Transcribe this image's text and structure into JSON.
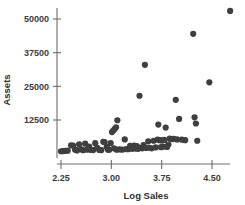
{
  "chart_data": {
    "type": "scatter",
    "title": "",
    "xlabel": "Log Sales",
    "ylabel": "Assets",
    "xlim": [
      2.11,
      4.92
    ],
    "ylim": [
      0,
      56000
    ],
    "xticks": [
      "2.25",
      "3.00",
      "3.75",
      "4.50"
    ],
    "xtick_values": [
      2.25,
      3.0,
      3.75,
      4.5
    ],
    "yticks": [
      "12500",
      "25000",
      "37500",
      "50000"
    ],
    "ytick_values": [
      12500,
      25000,
      37500,
      50000
    ],
    "grid": false,
    "legend": false,
    "marker_color": "#3f3f3f",
    "axis_color": "#6e6e6e",
    "marker_size": 3.1,
    "points": [
      [
        2.25,
        900
      ],
      [
        2.28,
        950
      ],
      [
        2.31,
        1000
      ],
      [
        2.35,
        1100
      ],
      [
        2.4,
        3100
      ],
      [
        2.43,
        3000
      ],
      [
        2.46,
        1500
      ],
      [
        2.49,
        1200
      ],
      [
        2.52,
        3500
      ],
      [
        2.55,
        1600
      ],
      [
        2.58,
        1300
      ],
      [
        2.61,
        3700
      ],
      [
        2.64,
        1500
      ],
      [
        2.67,
        2600
      ],
      [
        2.7,
        1400
      ],
      [
        2.73,
        1350
      ],
      [
        2.76,
        3900
      ],
      [
        2.79,
        2200
      ],
      [
        2.82,
        1400
      ],
      [
        2.85,
        1300
      ],
      [
        2.88,
        4400
      ],
      [
        2.9,
        4300
      ],
      [
        2.93,
        2500
      ],
      [
        2.95,
        1500
      ],
      [
        2.97,
        1450
      ],
      [
        2.99,
        3900
      ],
      [
        3.01,
        8000
      ],
      [
        3.03,
        8600
      ],
      [
        3.05,
        9200
      ],
      [
        3.07,
        9800
      ],
      [
        3.09,
        12400
      ],
      [
        3.04,
        2000
      ],
      [
        3.08,
        1500
      ],
      [
        3.12,
        1600
      ],
      [
        3.16,
        1500
      ],
      [
        3.2,
        5300
      ],
      [
        3.22,
        1700
      ],
      [
        3.25,
        1650
      ],
      [
        3.28,
        2900
      ],
      [
        3.31,
        1800
      ],
      [
        3.34,
        3000
      ],
      [
        3.36,
        1900
      ],
      [
        3.38,
        2800
      ],
      [
        3.4,
        1800
      ],
      [
        3.42,
        21500
      ],
      [
        3.44,
        2100
      ],
      [
        3.46,
        2000
      ],
      [
        3.48,
        3200
      ],
      [
        3.5,
        33000
      ],
      [
        3.52,
        2100
      ],
      [
        3.55,
        4600
      ],
      [
        3.57,
        2200
      ],
      [
        3.6,
        2000
      ],
      [
        3.63,
        4800
      ],
      [
        3.66,
        2300
      ],
      [
        3.69,
        5200
      ],
      [
        3.7,
        10800
      ],
      [
        3.72,
        5000
      ],
      [
        3.74,
        2400
      ],
      [
        3.75,
        4900
      ],
      [
        3.77,
        2600
      ],
      [
        3.79,
        5100
      ],
      [
        3.81,
        9700
      ],
      [
        3.83,
        2500
      ],
      [
        3.85,
        3400
      ],
      [
        3.87,
        5600
      ],
      [
        3.9,
        5400
      ],
      [
        3.93,
        5500
      ],
      [
        3.96,
        20000
      ],
      [
        3.98,
        5300
      ],
      [
        4.01,
        12900
      ],
      [
        4.05,
        5200
      ],
      [
        4.1,
        5000
      ],
      [
        4.22,
        44500
      ],
      [
        4.24,
        13500
      ],
      [
        4.26,
        11200
      ],
      [
        4.28,
        4800
      ],
      [
        4.46,
        26500
      ],
      [
        4.77,
        53000
      ]
    ]
  }
}
